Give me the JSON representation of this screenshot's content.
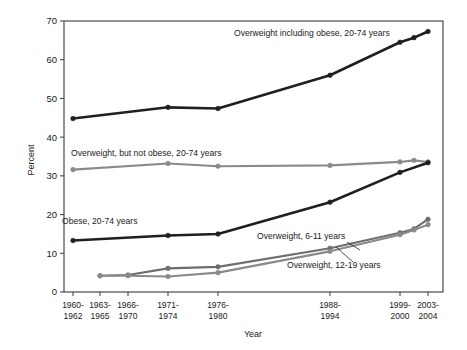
{
  "chart_data": {
    "type": "line",
    "title": "",
    "xlabel": "Year",
    "ylabel": "Percent",
    "ylim": [
      0,
      70
    ],
    "yticks": [
      0,
      10,
      20,
      30,
      40,
      50,
      60,
      70
    ],
    "grid": false,
    "legend": "inline-annotations",
    "categories": [
      "1960-\n1962",
      "1963-\n1965",
      "1966-\n1970",
      "1971-\n1974",
      "1976-\n1980",
      "1988-\n1994",
      "1999-\n2000",
      "2003-\n2004"
    ],
    "category_labels_line1": [
      "1960-",
      "1963-",
      "1966-",
      "1971-",
      "1976-",
      "1988-",
      "1999-",
      "2003-"
    ],
    "category_labels_line2": [
      "1962",
      "1965",
      "1970",
      "1974",
      "1980",
      "1994",
      "2000",
      "2004"
    ],
    "category_x_px": [
      73,
      100,
      128,
      168,
      218,
      330,
      400,
      428
    ],
    "series": [
      {
        "name": "Overweight including obese, 20-74 years",
        "color": "#1f1f1f",
        "width": 2.6,
        "points": [
          {
            "x_px": 73,
            "value": 44.8
          },
          {
            "x_px": 168,
            "value": 47.7
          },
          {
            "x_px": 218,
            "value": 47.4
          },
          {
            "x_px": 330,
            "value": 56.0
          },
          {
            "x_px": 400,
            "value": 64.5
          },
          {
            "x_px": 414,
            "value": 65.7
          },
          {
            "x_px": 428,
            "value": 67.3
          }
        ]
      },
      {
        "name": "Overweight, but not obese, 20-74 years",
        "color": "#8a8a8a",
        "width": 2.1,
        "points": [
          {
            "x_px": 73,
            "value": 31.6
          },
          {
            "x_px": 168,
            "value": 33.2
          },
          {
            "x_px": 218,
            "value": 32.5
          },
          {
            "x_px": 330,
            "value": 32.7
          },
          {
            "x_px": 400,
            "value": 33.6
          },
          {
            "x_px": 414,
            "value": 34.0
          },
          {
            "x_px": 428,
            "value": 33.6
          }
        ]
      },
      {
        "name": "Obese, 20-74 years",
        "color": "#1f1f1f",
        "width": 2.6,
        "points": [
          {
            "x_px": 73,
            "value": 13.3
          },
          {
            "x_px": 168,
            "value": 14.6
          },
          {
            "x_px": 218,
            "value": 15.0
          },
          {
            "x_px": 330,
            "value": 23.2
          },
          {
            "x_px": 400,
            "value": 30.9
          },
          {
            "x_px": 428,
            "value": 33.4
          }
        ]
      },
      {
        "name": "Overweight, 6-11 years",
        "color": "#6e6e6e",
        "width": 2.1,
        "points": [
          {
            "x_px": 100,
            "value": 4.2
          },
          {
            "x_px": 128,
            "value": 4.4
          },
          {
            "x_px": 168,
            "value": 6.1
          },
          {
            "x_px": 218,
            "value": 6.5
          },
          {
            "x_px": 330,
            "value": 11.3
          },
          {
            "x_px": 400,
            "value": 15.3
          },
          {
            "x_px": 414,
            "value": 16.3
          },
          {
            "x_px": 428,
            "value": 18.8
          }
        ]
      },
      {
        "name": "Overweight, 12-19 years",
        "color": "#8a8a8a",
        "width": 2.1,
        "points": [
          {
            "x_px": 100,
            "value": 4.2
          },
          {
            "x_px": 128,
            "value": 4.2
          },
          {
            "x_px": 168,
            "value": 4.0
          },
          {
            "x_px": 218,
            "value": 5.0
          },
          {
            "x_px": 330,
            "value": 10.5
          },
          {
            "x_px": 400,
            "value": 14.8
          },
          {
            "x_px": 414,
            "value": 16.0
          },
          {
            "x_px": 428,
            "value": 17.4
          }
        ]
      }
    ],
    "annotations": [
      {
        "id": "annot-overweight-including-obese",
        "text": "Overweight including obese, 20-74 years",
        "x_px": 234,
        "y_px": 36
      },
      {
        "id": "annot-overweight-not-obese",
        "text": "Overweight, but not obese, 20-74 years",
        "x_px": 71,
        "y_px": 156
      },
      {
        "id": "annot-obese",
        "text": "Obese, 20-74 years",
        "x_px": 62,
        "y_px": 224
      },
      {
        "id": "annot-overweight-6-11",
        "text": "Overweight, 6-11 years",
        "x_px": 257,
        "y_px": 239
      },
      {
        "id": "annot-overweight-12-19",
        "text": "Overweight, 12-19 years",
        "x_px": 287,
        "y_px": 268
      }
    ],
    "leader_lines": [
      {
        "id": "leader-6-11",
        "x1": 347,
        "y1": 242,
        "x2": 360,
        "y2": 250
      },
      {
        "id": "leader-12-19",
        "x1": 353,
        "y1": 262,
        "x2": 336,
        "y2": 247
      }
    ]
  },
  "axes": {
    "y_title": "Percent",
    "x_title": "Year",
    "frame_color": "#3a3a3a"
  }
}
